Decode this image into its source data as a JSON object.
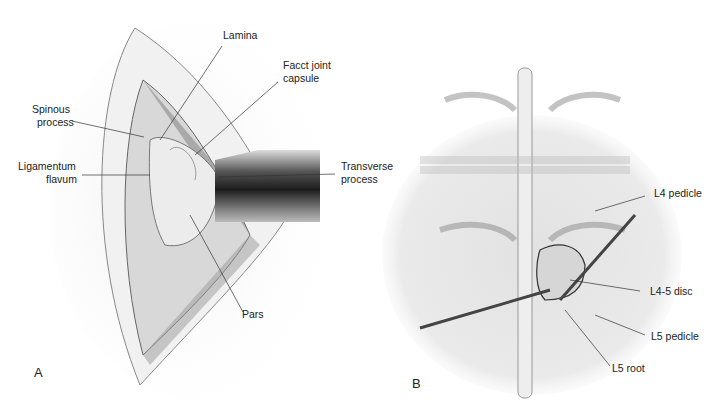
{
  "panel_a": {
    "letter": "A",
    "labels": {
      "lamina": "Lamina",
      "facet_1": "Facct joint",
      "facet_2": "capsule",
      "spinous_1": "Spinous",
      "spinous_2": "process",
      "lig_1": "Ligamentum",
      "lig_2": "flavum",
      "trans_1": "Transverse",
      "trans_2": "process",
      "pars": "Pars"
    }
  },
  "panel_b": {
    "letter": "B",
    "labels": {
      "l4_pedicle": "L4 pedicle",
      "l45_disc": "L4-5 disc",
      "l5_pedicle": "L5 pedicle",
      "l5_root": "L5 root"
    }
  }
}
